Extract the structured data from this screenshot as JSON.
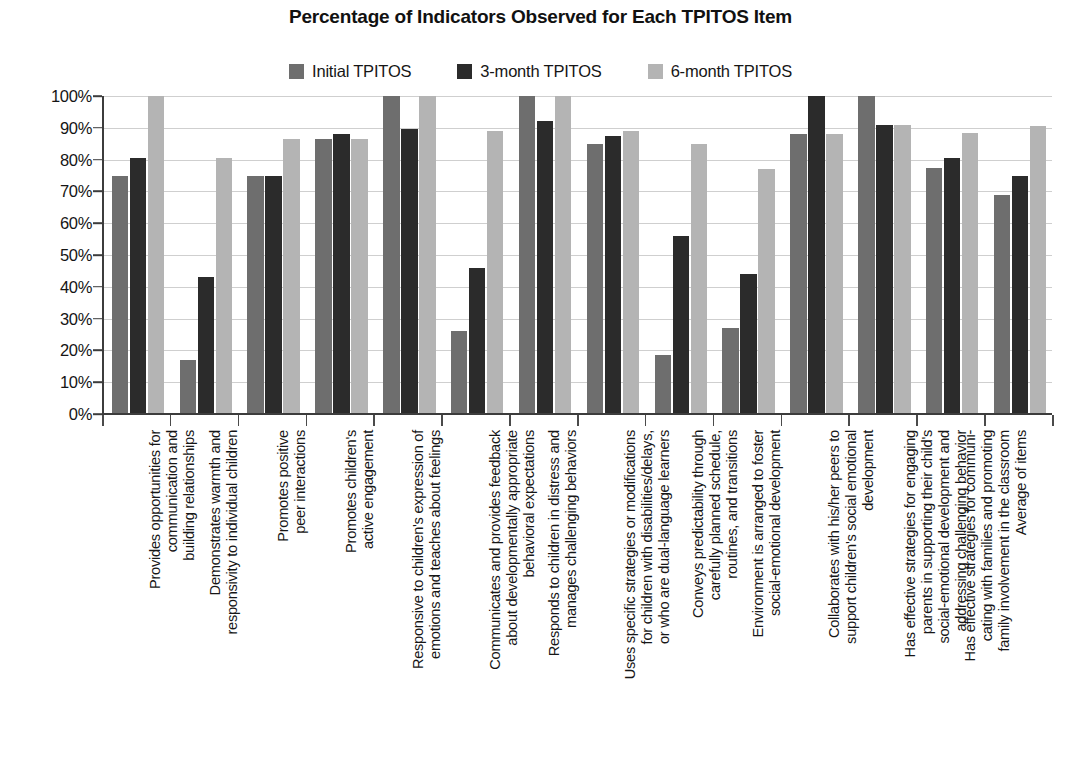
{
  "chart_data": {
    "type": "bar",
    "title": "Percentage of Indicators Observed for Each TPITOS Item",
    "xlabel": "",
    "ylabel": "",
    "ylim": [
      0,
      100
    ],
    "grid": true,
    "legend_position": "top-center",
    "ytick_labels": [
      "0%",
      "10%",
      "20%",
      "30%",
      "40%",
      "50%",
      "60%",
      "70%",
      "80%",
      "90%",
      "100%"
    ],
    "ytick_values": [
      0,
      10,
      20,
      30,
      40,
      50,
      60,
      70,
      80,
      90,
      100
    ],
    "categories": [
      "Provides opportunities for\ncommunication and\nbuilding relationships",
      "Demonstrates warmth and\nresponsivity to individual children",
      "Promotes positive\npeer interactions",
      "Promotes children's\nactive engagement",
      "Responsive to children's expression of\nemotions and teaches about feelings",
      "Communicates and provides feedback\nabout developmentally appropriate\nbehavioral expectations",
      "Responds to children in distress and\nmanages challenging behaviors",
      "Uses specific strategies or modifications\nfor children with disabilities/delays,\nor who are dual-language learners",
      "Conveys predictability through\ncarefully planned schedule,\nroutines, and transitions",
      "Environment is arranged to foster\nsocial-emotional development",
      "Collaborates with his/her peers to\nsupport children's social emotional\ndevelopment",
      "Has effective strategies for engaging\nparents in supporting their child's\nsocial-emotional development and\naddressing challenging behavior",
      "Has effective strategies for communi-\ncating with families and promoting\nfamily involvement in the classroom",
      "Average of items"
    ],
    "series": [
      {
        "name": "Initial TPITOS",
        "color": "#6e6e6e",
        "values": [
          75,
          17,
          75,
          86.5,
          100,
          26,
          100,
          85,
          18.5,
          27,
          88,
          100,
          77.5,
          69
        ]
      },
      {
        "name": "3-month TPITOS",
        "color": "#2b2b2b",
        "values": [
          80.5,
          43,
          75,
          88,
          89.5,
          46,
          92,
          87.5,
          56,
          44,
          100,
          91,
          80.5,
          75
        ]
      },
      {
        "name": "6-month TPITOS",
        "color": "#b4b4b4",
        "values": [
          100,
          80.5,
          86.5,
          86.5,
          100,
          89,
          100,
          89,
          85,
          77,
          88,
          91,
          88.5,
          90.5
        ]
      }
    ]
  },
  "legend": {
    "items": [
      {
        "label": "Initial TPITOS",
        "color": "#6e6e6e"
      },
      {
        "label": "3-month TPITOS",
        "color": "#2b2b2b"
      },
      {
        "label": "6-month TPITOS",
        "color": "#b4b4b4"
      }
    ]
  },
  "colors": {
    "axis": "#3c3c3c",
    "grid": "#cfcfcf",
    "text": "#161616",
    "background": "#ffffff"
  }
}
